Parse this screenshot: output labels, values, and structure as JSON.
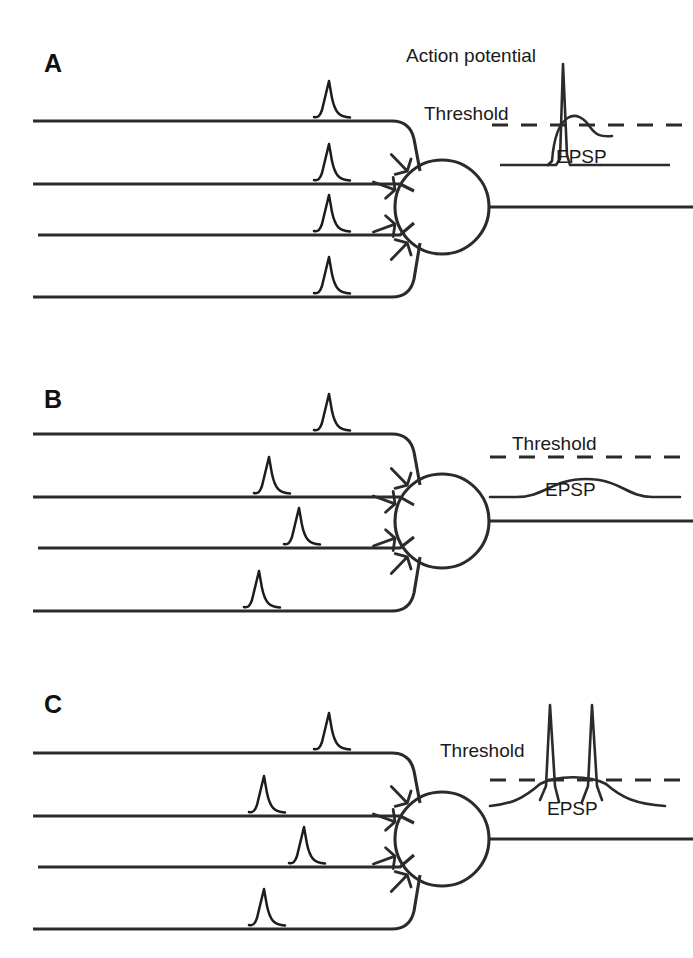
{
  "figure": {
    "background_color": "#ffffff",
    "ink_color": "#2b2b2b",
    "width": 693,
    "height": 958
  },
  "panels": [
    {
      "id": "A",
      "letter": "A",
      "letter_x": 44,
      "letter_y": 72,
      "description": "Single input fires; EPSP reaches threshold and triggers one action potential",
      "presynaptic_axon_count": 4,
      "axons": [
        {
          "index": 0,
          "y": 121,
          "x_start": 33,
          "x_end": 392,
          "spike_x": 330,
          "spike_height": 38,
          "firing": true
        },
        {
          "index": 1,
          "y": 184,
          "x_start": 33,
          "x_end": 392,
          "spike_x": 330,
          "spike_height": 38,
          "firing": true
        },
        {
          "index": 2,
          "y": 235,
          "x_start": 38,
          "x_end": 392,
          "spike_x": 330,
          "spike_height": 38,
          "firing": true
        },
        {
          "index": 3,
          "y": 297,
          "x_start": 33,
          "x_end": 392,
          "spike_x": 330,
          "spike_height": 38,
          "firing": true
        }
      ],
      "soma": {
        "cx": 442,
        "cy": 207,
        "r": 47
      },
      "output_axon": {
        "y": 207,
        "x_start": 489,
        "x_end": 693
      },
      "trace": {
        "baseline_y": 165,
        "threshold_y": 125,
        "threshold_label": "Threshold",
        "threshold_label_x": 424,
        "threshold_label_y": 120,
        "threshold_dash_x_start": 492,
        "threshold_dash_x_end": 690,
        "epsp_label": "EPSP",
        "epsp_label_x": 556,
        "epsp_label_y": 163,
        "action_potential_label": "Action potential",
        "action_potential_label_x": 406,
        "action_potential_label_y": 62,
        "spike_count": 1,
        "spike_peak_y": 64,
        "crosses_threshold": true,
        "epsp_peak_y": 118
      }
    },
    {
      "id": "B",
      "letter": "B",
      "letter_x": 44,
      "letter_y": 408,
      "description": "Weak asynchronous inputs produce a subthreshold EPSP; no action potential",
      "presynaptic_axon_count": 4,
      "axons": [
        {
          "index": 0,
          "y": 434,
          "x_start": 33,
          "x_end": 392,
          "spike_x": 330,
          "spike_height": 38,
          "firing": true
        },
        {
          "index": 1,
          "y": 497,
          "x_start": 33,
          "x_end": 392,
          "spike_x": 270,
          "spike_height": 38,
          "firing": true
        },
        {
          "index": 2,
          "y": 548,
          "x_start": 38,
          "x_end": 392,
          "spike_x": 300,
          "spike_height": 38,
          "firing": true
        },
        {
          "index": 3,
          "y": 611,
          "x_start": 33,
          "x_end": 392,
          "spike_x": 260,
          "spike_height": 38,
          "firing": true
        }
      ],
      "soma": {
        "cx": 442,
        "cy": 521,
        "r": 47
      },
      "output_axon": {
        "y": 521,
        "x_start": 489,
        "x_end": 693
      },
      "trace": {
        "baseline_y": 521,
        "threshold_y": 457,
        "threshold_label": "Threshold",
        "threshold_label_x": 512,
        "threshold_label_y": 450,
        "threshold_dash_x_start": 490,
        "threshold_dash_x_end": 690,
        "epsp_label": "EPSP",
        "epsp_label_x": 545,
        "epsp_label_y": 496,
        "spike_count": 0,
        "crosses_threshold": false,
        "epsp_peak_y": 479
      }
    },
    {
      "id": "C",
      "letter": "C",
      "letter_x": 44,
      "letter_y": 713,
      "description": "Summed synchronous inputs drive a large EPSP above threshold producing two action potentials",
      "presynaptic_axon_count": 4,
      "axons": [
        {
          "index": 0,
          "y": 753,
          "x_start": 33,
          "x_end": 392,
          "spike_x": 330,
          "spike_height": 38,
          "firing": true
        },
        {
          "index": 1,
          "y": 816,
          "x_start": 33,
          "x_end": 392,
          "spike_x": 265,
          "spike_height": 38,
          "firing": true
        },
        {
          "index": 2,
          "y": 867,
          "x_start": 38,
          "x_end": 392,
          "spike_x": 305,
          "spike_height": 38,
          "firing": true
        },
        {
          "index": 3,
          "y": 929,
          "x_start": 33,
          "x_end": 392,
          "spike_x": 265,
          "spike_height": 38,
          "firing": true
        }
      ],
      "soma": {
        "cx": 442,
        "cy": 839,
        "r": 47
      },
      "output_axon": {
        "y": 839,
        "x_start": 489,
        "x_end": 693
      },
      "trace": {
        "baseline_y": 800,
        "threshold_y": 780,
        "threshold_label": "Threshold",
        "threshold_label_x": 440,
        "threshold_label_y": 757,
        "threshold_dash_x_start": 490,
        "threshold_dash_x_end": 690,
        "epsp_label": "EPSP",
        "epsp_label_x": 547,
        "epsp_label_y": 815,
        "spike_count": 2,
        "spike_peak_y": 705,
        "crosses_threshold": true,
        "epsp_peak_y": 775
      }
    }
  ],
  "legend": {
    "action_potential": "Action potential",
    "threshold": "Threshold",
    "epsp": "EPSP"
  }
}
